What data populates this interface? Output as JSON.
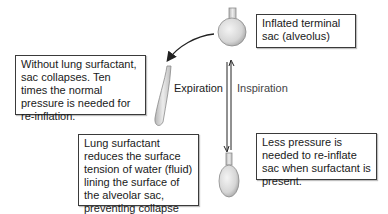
{
  "diagram": {
    "boxes": {
      "inflated_sac": "Inflated terminal sac (alveolus)",
      "without_surfactant": "Without lung surfactant, sac collapses. Ten times the normal pressure is needed for re-inflation.",
      "surfactant_role": "Lung surfactant reduces the surface tension of water (fluid) lining the surface of the alveolar sac, preventing collapse",
      "less_pressure": "Less pressure is needed to re-inflate sac when surfactant is present."
    },
    "arrow_labels": {
      "expiration": "Expiration",
      "inspiration": "Inspiration"
    },
    "nodes": [
      {
        "id": "inflated-sac",
        "shape": "round flask"
      },
      {
        "id": "collapsed-sac",
        "shape": "thin curved tube"
      },
      {
        "id": "partially-deflated-sac",
        "shape": "oval flask"
      }
    ],
    "colors": {
      "sac_fill": "#d9d9d9",
      "sac_stroke": "#8a8a8a",
      "border": "#3a3a3a",
      "arrow": "#222222"
    }
  }
}
